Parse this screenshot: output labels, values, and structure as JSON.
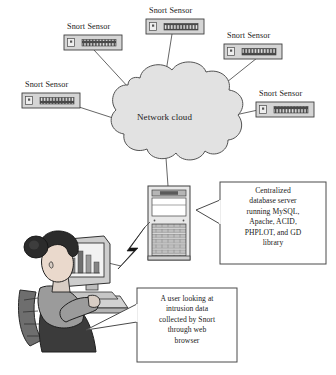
{
  "diagram": {
    "type": "network-topology-diagram",
    "background_color": "#ffffff",
    "stroke_color": "#3a3a3a",
    "cloud_fill": "#e2e2e2",
    "device_fill": "#d5d5d5",
    "device_band_color": "#4a4a4a"
  },
  "cloud": {
    "label": "Network cloud"
  },
  "sensors": [
    {
      "id": "sensor-top-left",
      "label": "Snort Sensor"
    },
    {
      "id": "sensor-top-center",
      "label": "Snort Sensor"
    },
    {
      "id": "sensor-top-right",
      "label": "Snort Sensor"
    },
    {
      "id": "sensor-mid-left",
      "label": "Snort Sensor"
    },
    {
      "id": "sensor-mid-right",
      "label": "Snort Sensor"
    }
  ],
  "server": {
    "name": "Centralized database server",
    "icon": "tower-server-icon"
  },
  "workstation": {
    "name": "User workstation",
    "icon": "user-at-computer-icon",
    "screen_content": "bar-chart"
  },
  "link": {
    "name": "wireless-lightning-link",
    "icon": "lightning-bolt-icon"
  },
  "callouts": [
    {
      "id": "callout-server",
      "lines": [
        "Centralized",
        "database server",
        "running MySQL,",
        "Apache, ACID,",
        "PHPLOT, and GD",
        "library"
      ]
    },
    {
      "id": "callout-user",
      "lines": [
        "A user looking at",
        "intrusion data",
        "collected by Snort",
        "through web",
        "browser"
      ]
    }
  ]
}
